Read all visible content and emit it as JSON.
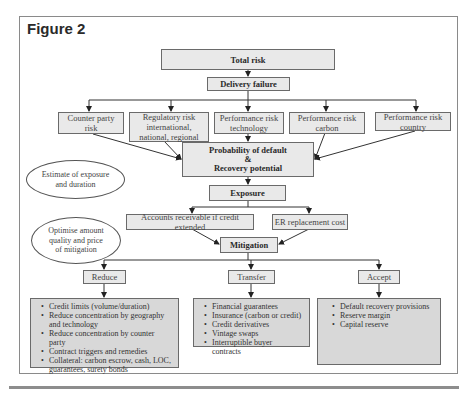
{
  "figure": {
    "title": "Figure 2"
  },
  "nodes": {
    "total_risk": "Total risk",
    "delivery_failure": "Delivery failure",
    "risks": [
      {
        "label": "Counter party risk"
      },
      {
        "label": "Regulatory risk international, national, regional"
      },
      {
        "label": "Performance risk technology"
      },
      {
        "label": "Performance risk carbon"
      },
      {
        "label": "Performance risk country"
      }
    ],
    "probability": {
      "line1": "Probability of default",
      "line2": "&",
      "line3": "Recovery potential"
    },
    "exposure": "Exposure",
    "exposure_items": [
      {
        "label": "Accounts receivable if credit extended"
      },
      {
        "label": "ER replacement cost"
      }
    ],
    "mitigation": "Mitigation",
    "strategies": [
      {
        "label": "Reduce",
        "items": [
          "Credit limits (volume/duration)",
          "Reduce concentration by geography and technology",
          "Reduce concentration by counter party",
          "Contract triggers and remedies",
          "Collateral: carbon escrow, cash, LOC, guarantees, surety bonds"
        ]
      },
      {
        "label": "Transfer",
        "items": [
          "Financial guarantees",
          "Insurance (carbon or credit)",
          "Credit derivatives",
          "Vintage swaps",
          "Interruptible buyer contracts"
        ]
      },
      {
        "label": "Accept",
        "items": [
          "Default recovery provisions",
          "Reserve margin",
          "Capital reserve"
        ]
      }
    ]
  },
  "annotations": {
    "estimate": "Estimate of exposure and duration",
    "optimise": "Optimise amount quality and price of mitigation"
  },
  "colors": {
    "box_fill": "#e9e9e9",
    "list_fill": "#d8d8d8",
    "border": "#6a6a6a",
    "rule": "#8d8d8d"
  }
}
